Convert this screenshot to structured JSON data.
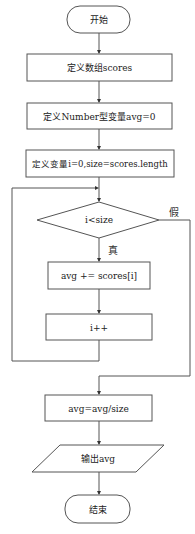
{
  "flowchart": {
    "nodes": {
      "start": {
        "type": "terminator",
        "label": "开始"
      },
      "define_array": {
        "type": "process",
        "label": "定义数组scores"
      },
      "define_avg": {
        "type": "process",
        "label": "定义Number型变量avg=0"
      },
      "define_vars": {
        "type": "process",
        "label": "定义变量i=0,size=scores.length"
      },
      "condition": {
        "type": "decision",
        "label": "i<size"
      },
      "accumulate": {
        "type": "process",
        "label": "avg += scores[i]"
      },
      "increment": {
        "type": "process",
        "label": "i++"
      },
      "compute_avg": {
        "type": "process",
        "label": "avg=avg/size"
      },
      "output": {
        "type": "io",
        "label": "输出avg"
      },
      "end": {
        "type": "terminator",
        "label": "结束"
      }
    },
    "edge_labels": {
      "true": "真",
      "false": "假"
    },
    "colors": {
      "stroke": "#555555",
      "fill": "#ffffff",
      "text": "#222222"
    }
  }
}
